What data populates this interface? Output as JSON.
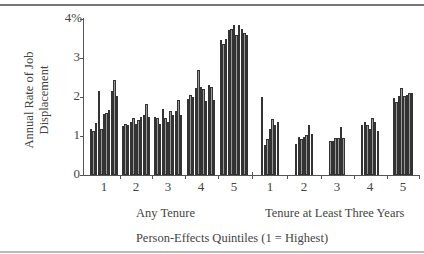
{
  "chart_data": {
    "type": "bar",
    "title": "",
    "ylabel": "Annual Rate of Job Displacement",
    "xlabel": "Person-Effects Quintiles (1 = Highest)",
    "ylim": [
      0,
      4
    ],
    "yticks": [
      "0",
      "1",
      "2",
      "3",
      "4%"
    ],
    "grid": false,
    "legend": null,
    "panels": [
      {
        "name": "Any Tenure",
        "categories": [
          "1",
          "2",
          "3",
          "4",
          "5"
        ],
        "groups": [
          {
            "quintile": "1",
            "values": [
              1.17,
              1.12,
              1.33,
              2.15,
              1.17,
              1.57,
              1.6,
              1.67,
              2.15,
              2.43,
              2.02
            ]
          },
          {
            "quintile": "2",
            "values": [
              1.25,
              1.3,
              1.27,
              1.37,
              1.47,
              1.32,
              1.4,
              1.5,
              1.55,
              1.83,
              1.5
            ]
          },
          {
            "quintile": "3",
            "values": [
              1.48,
              1.47,
              1.32,
              1.7,
              1.45,
              1.37,
              1.63,
              1.55,
              1.63,
              1.92,
              1.55
            ]
          },
          {
            "quintile": "4",
            "values": [
              1.95,
              2.05,
              2.0,
              2.22,
              2.68,
              2.25,
              2.2,
              1.9,
              2.3,
              2.25,
              1.92
            ]
          },
          {
            "quintile": "5",
            "values": [
              3.45,
              3.35,
              3.5,
              3.73,
              3.75,
              3.85,
              3.6,
              3.85,
              3.75,
              3.63,
              3.6
            ]
          }
        ]
      },
      {
        "name": "Tenure at Least Three Years",
        "categories": [
          "1",
          "2",
          "3",
          "4",
          "5"
        ],
        "groups": [
          {
            "quintile": "1",
            "values": [
              2.0,
              0.78,
              0.93,
              1.17,
              1.43,
              1.28,
              1.35
            ]
          },
          {
            "quintile": "2",
            "values": [
              0.8,
              0.97,
              0.92,
              0.97,
              1.03,
              1.27,
              1.05
            ]
          },
          {
            "quintile": "3",
            "values": [
              0.88,
              0.88,
              0.95,
              0.95,
              1.22,
              0.95
            ]
          },
          {
            "quintile": "4",
            "values": [
              1.28,
              1.35,
              1.27,
              1.17,
              1.45,
              1.37,
              1.12
            ]
          },
          {
            "quintile": "5",
            "values": [
              1.98,
              1.88,
              2.03,
              2.22,
              2.02,
              2.05,
              2.1,
              2.1
            ]
          }
        ]
      }
    ]
  },
  "labels": {
    "ylabel": "Annual Rate of Job Displacement",
    "yticks": {
      "t0": "0",
      "t1": "1",
      "t2": "2",
      "t3": "3",
      "t4": "4%"
    },
    "panel1": "Any Tenure",
    "panel2": "Tenure at Least Three Years",
    "xtitle": "Person-Effects Quintiles (1 = Highest)",
    "cats": [
      "1",
      "2",
      "3",
      "4",
      "5",
      "1",
      "2",
      "3",
      "4",
      "5"
    ]
  },
  "colors": {
    "bar_fill": "#999999",
    "bar_edge": "#333333",
    "axis": "#555555"
  }
}
